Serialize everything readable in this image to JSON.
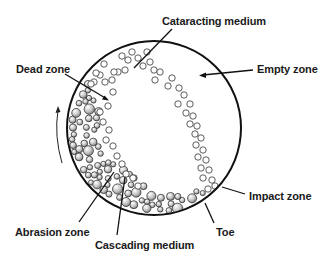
{
  "diagram": {
    "type": "ball-mill-cross-section",
    "mill": {
      "cx": 154,
      "cy": 128,
      "r": 87,
      "stroke": "#111111"
    },
    "labels": {
      "cataracting_medium": "Cataracting medium",
      "empty_zone": "Empty zone",
      "dead_zone": "Dead zone",
      "impact_zone": "Impact zone",
      "toe": "Toe",
      "abrasion_zone": "Abrasion zone",
      "cascading_medium": "Cascading medium"
    },
    "rotation_direction": "counter-clockwise (arrow pointing up on left side)",
    "colors": {
      "line": "#111111",
      "ball_light": "#ffffff",
      "ball_dark": "#8a8a8a",
      "background": "#ffffff"
    }
  }
}
